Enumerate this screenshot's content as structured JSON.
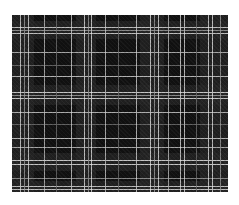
{
  "image": {
    "subject": "black and white tartan plaid fabric swatch",
    "background_color": "#ffffff",
    "fabric": {
      "x": 12,
      "y": 15,
      "width": 216,
      "height": 177,
      "base_color": "#111111"
    },
    "dark_bands": {
      "color": "#262626",
      "vertical": [
        [
          0,
          22
        ],
        [
          64,
          20
        ],
        [
          128,
          24
        ],
        [
          188,
          28
        ]
      ],
      "horizontal": [
        [
          6,
          18
        ],
        [
          70,
          20
        ],
        [
          138,
          18
        ],
        [
          166,
          11
        ]
      ]
    },
    "vertical_lines": [
      {
        "x": 8,
        "w": 1,
        "color": "#d8d8d8"
      },
      {
        "x": 12,
        "w": 1,
        "color": "#9a9a9a"
      },
      {
        "x": 16,
        "w": 1,
        "color": "#d8d8d8"
      },
      {
        "x": 32,
        "w": 1,
        "color": "#bdbdbd"
      },
      {
        "x": 44,
        "w": 1,
        "color": "#6e6e6e"
      },
      {
        "x": 59,
        "w": 1,
        "color": "#d0d0d0"
      },
      {
        "x": 72,
        "w": 1,
        "color": "#e0e0e0"
      },
      {
        "x": 76,
        "w": 1,
        "color": "#9a9a9a"
      },
      {
        "x": 79,
        "w": 1,
        "color": "#e0e0e0"
      },
      {
        "x": 93,
        "w": 1,
        "color": "#c8c8c8"
      },
      {
        "x": 106,
        "w": 1,
        "color": "#6e6e6e"
      },
      {
        "x": 124,
        "w": 1,
        "color": "#d0d0d0"
      },
      {
        "x": 138,
        "w": 1,
        "color": "#e0e0e0"
      },
      {
        "x": 142,
        "w": 1,
        "color": "#9a9a9a"
      },
      {
        "x": 146,
        "w": 1,
        "color": "#e0e0e0"
      },
      {
        "x": 156,
        "w": 1,
        "color": "#bdbdbd"
      },
      {
        "x": 168,
        "w": 1,
        "color": "#d8d8d8"
      },
      {
        "x": 172,
        "w": 1,
        "color": "#d8d8d8"
      },
      {
        "x": 184,
        "w": 1,
        "color": "#6e6e6e"
      },
      {
        "x": 196,
        "w": 1,
        "color": "#e0e0e0"
      },
      {
        "x": 200,
        "w": 1,
        "color": "#e0e0e0"
      },
      {
        "x": 208,
        "w": 1,
        "color": "#9a9a9a"
      }
    ],
    "horizontal_lines": [
      {
        "y": 12,
        "h": 1,
        "color": "#d8d8d8"
      },
      {
        "y": 15,
        "h": 1,
        "color": "#9a9a9a"
      },
      {
        "y": 18,
        "h": 1,
        "color": "#d8d8d8"
      },
      {
        "y": 37,
        "h": 1,
        "color": "#bdbdbd"
      },
      {
        "y": 50,
        "h": 1,
        "color": "#6e6e6e"
      },
      {
        "y": 61,
        "h": 1,
        "color": "#d0d0d0"
      },
      {
        "y": 77,
        "h": 1,
        "color": "#e0e0e0"
      },
      {
        "y": 80,
        "h": 1,
        "color": "#9a9a9a"
      },
      {
        "y": 83,
        "h": 1,
        "color": "#e0e0e0"
      },
      {
        "y": 97,
        "h": 1,
        "color": "#c8c8c8"
      },
      {
        "y": 109,
        "h": 1,
        "color": "#6e6e6e"
      },
      {
        "y": 123,
        "h": 1,
        "color": "#d0d0d0"
      },
      {
        "y": 132,
        "h": 1,
        "color": "#bdbdbd"
      },
      {
        "y": 145,
        "h": 1,
        "color": "#e0e0e0"
      },
      {
        "y": 149,
        "h": 1,
        "color": "#e0e0e0"
      },
      {
        "y": 163,
        "h": 1,
        "color": "#9a9a9a"
      },
      {
        "y": 171,
        "h": 1,
        "color": "#d8d8d8"
      },
      {
        "y": 174,
        "h": 1,
        "color": "#d8d8d8"
      }
    ]
  }
}
